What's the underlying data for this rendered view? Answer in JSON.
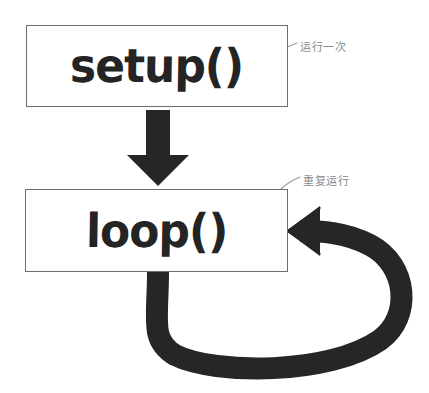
{
  "diagram": {
    "background_color": "#ffffff",
    "nodes": [
      {
        "id": "setup",
        "label": "setup()",
        "border_color": "#6e6e6e",
        "fill_color": "#ffffff",
        "text_color": "#242424"
      },
      {
        "id": "loop",
        "label": "loop()",
        "border_color": "#6e6e6e",
        "fill_color": "#ffffff",
        "text_color": "#242424"
      }
    ],
    "connectors": [
      {
        "id": "setup-to-loop",
        "kind": "down-arrow",
        "from": "setup",
        "to": "loop",
        "color": "#262626"
      },
      {
        "id": "loop-feedback",
        "kind": "loop-back-arrow",
        "from": "loop",
        "to": "loop",
        "color": "#262626"
      }
    ],
    "callouts": [
      {
        "id": "run-once",
        "text": "运行一次",
        "color": "#8a8a8a",
        "points_to": "setup"
      },
      {
        "id": "repeat",
        "text": "重复运行",
        "color": "#8a8a8a",
        "points_to": "loop"
      }
    ]
  }
}
